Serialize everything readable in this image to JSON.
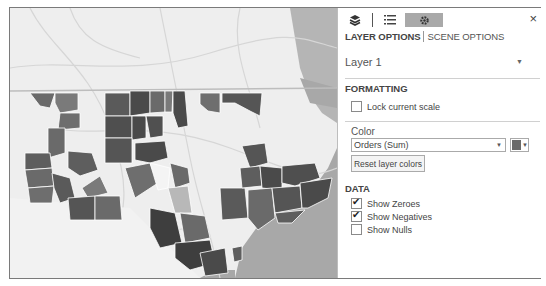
{
  "toolbar": {
    "icons": [
      "layers-icon",
      "field-list-icon",
      "settings-icon"
    ],
    "active_icon": "settings-icon",
    "close_label": "×"
  },
  "tabs": [
    {
      "label": "LAYER OPTIONS",
      "active": true
    },
    {
      "label": "SCENE OPTIONS",
      "active": false
    }
  ],
  "layer": {
    "selected": "Layer 1"
  },
  "formatting": {
    "heading": "FORMATTING",
    "lock_scale": {
      "label": "Lock current scale",
      "checked": false
    }
  },
  "color": {
    "label": "Color",
    "select_value": "Orders (Sum)",
    "swatch_color": "#6a6a6a",
    "reset_label": "Reset layer colors"
  },
  "data": {
    "heading": "DATA",
    "options": [
      {
        "label": "Show Zeroes",
        "checked": true
      },
      {
        "label": "Show Negatives",
        "checked": true
      },
      {
        "label": "Show Nulls",
        "checked": false
      }
    ]
  },
  "map": {
    "description": "Choropleth of counties shaded by Orders (Sum)",
    "colors": {
      "land": "#eeeeee",
      "water": "#a8a8a8",
      "dark": "#4a4a4a",
      "mid": "#6e6e6e",
      "light": "#9a9a9a",
      "road": "#d8d8d8"
    }
  }
}
